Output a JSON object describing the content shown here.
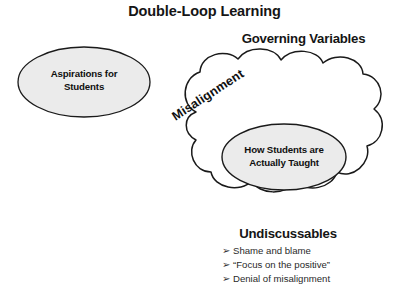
{
  "diagram": {
    "title": "Double-Loop Learning",
    "background_color": "#ffffff",
    "stroke_color": "#1a1a1a",
    "shape_fill": "#ebebeb",
    "headings": {
      "governing_variables": "Governing Variables",
      "undiscussables": "Undiscussables"
    },
    "shapes": {
      "aspirations_ellipse": {
        "line1": "Aspirations for",
        "line2": "Students"
      },
      "taught_ellipse": {
        "line1": "How Students are",
        "line2": "Actually Taught"
      },
      "cloud_label": "Misalignment"
    },
    "undiscussables_list": {
      "marker": "➢",
      "items": [
        "Shame and blame",
        "“Focus on the positive”",
        "Denial of misalignment"
      ]
    }
  }
}
